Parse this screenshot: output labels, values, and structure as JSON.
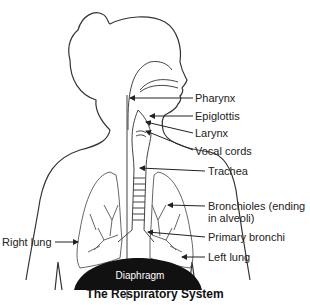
{
  "title": "The Respiratory System",
  "labels": {
    "pharynx": "Pharynx",
    "epiglottis": "Epiglottis",
    "larynx": "Larynx",
    "vocal_cords": "Vocal cords",
    "trachea": "Trachea",
    "bronchioles_line1": "Bronchioles (ending",
    "bronchioles_line2": "in alveoli)",
    "primary_bronchi": "Primary bronchi",
    "left_lung": "Left lung",
    "right_lung": "Right lung",
    "diaphragm": "Diaphragm"
  },
  "colors": {
    "outline": "#333333",
    "diaphragm_fill": "#111111",
    "text": "#222222",
    "background": "#ffffff"
  }
}
